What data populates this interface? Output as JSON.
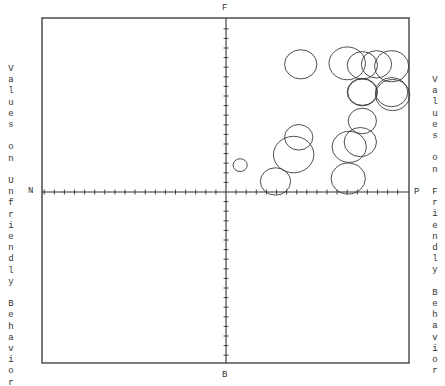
{
  "chart_data": {
    "type": "scatter",
    "subtype": "bubble",
    "title": "",
    "xlabel_left": "Values on Unfriendly Behavior",
    "xlabel_right": "Values on Friendly Behavior",
    "pole_labels": {
      "top": "F",
      "bottom": "B",
      "left": "N",
      "right": "P"
    },
    "axes": {
      "x_range": [
        -18,
        18
      ],
      "y_range": [
        -18,
        18
      ],
      "tick_interval": 1,
      "grid": false,
      "tick_labels": false
    },
    "frame_px": {
      "left": 42,
      "top": 18,
      "right": 409,
      "bottom": 363
    },
    "origin_px": {
      "x": 226,
      "y": 192
    },
    "unit_px": {
      "x": 10.1,
      "y": 9.6
    },
    "points": [
      {
        "x": 7.4,
        "y": 13.3,
        "r": 1.6
      },
      {
        "x": 12.0,
        "y": 13.4,
        "r": 1.8
      },
      {
        "x": 13.5,
        "y": 13.2,
        "r": 1.5
      },
      {
        "x": 14.9,
        "y": 13.3,
        "r": 1.5
      },
      {
        "x": 16.4,
        "y": 13.1,
        "r": 1.7
      },
      {
        "x": 13.5,
        "y": 10.4,
        "r": 1.5
      },
      {
        "x": 13.5,
        "y": 10.4,
        "r": 1.45
      },
      {
        "x": 16.4,
        "y": 10.4,
        "r": 1.6
      },
      {
        "x": 16.5,
        "y": 10.1,
        "r": 1.7
      },
      {
        "x": 13.5,
        "y": 7.4,
        "r": 1.4
      },
      {
        "x": 7.2,
        "y": 5.7,
        "r": 1.4
      },
      {
        "x": 6.7,
        "y": 3.9,
        "r": 2.0
      },
      {
        "x": 12.2,
        "y": 4.7,
        "r": 1.7
      },
      {
        "x": 13.3,
        "y": 5.2,
        "r": 1.6
      },
      {
        "x": 12.1,
        "y": 1.4,
        "r": 1.7
      },
      {
        "x": 4.9,
        "y": 1.1,
        "r": 1.5
      },
      {
        "x": 1.4,
        "y": 2.8,
        "r": 0.7
      }
    ]
  }
}
